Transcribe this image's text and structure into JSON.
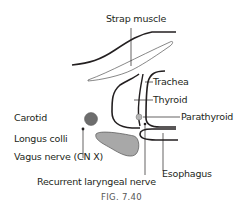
{
  "figure": {
    "caption": "FIG. 7.40",
    "labels": {
      "strap_muscle": "Strap muscle",
      "trachea": "Trachea",
      "thyroid": "Thyroid",
      "parathyroid": "Parathyroid",
      "carotid": "Carotid",
      "longus_colli": "Longus colli",
      "vagus_nerve": "Vagus nerve (CN X)",
      "recurrent_laryngeal_nerve": "Recurrent laryngeal nerve",
      "esophagus": "Esophagus"
    },
    "colors": {
      "line": "#231f20",
      "carotid_fill": "#6d6d6d",
      "longus_colli_fill": "#a8a8a8",
      "parathyroid_fill": "#b5b5b5"
    }
  }
}
